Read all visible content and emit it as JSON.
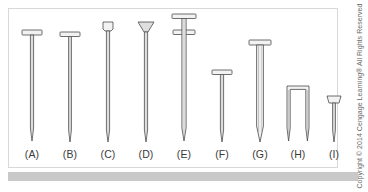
{
  "figure": {
    "background_color": "#ffffff",
    "frame_color": "#d8d8d8",
    "ground_bar_color": "#c9c9c9",
    "stroke_color": "#4a4a4a",
    "fill_color": "#f2f2f2",
    "label_color": "#3a3a3a"
  },
  "credit": {
    "text": "Copyright © 2014 Cengage Learning® All Rights Reserved",
    "color": "#6a6a6a"
  },
  "items": [
    {
      "label": "(A)",
      "name": "nail-a",
      "head": "flat-wide",
      "shank": "slender",
      "x": 14
    },
    {
      "label": "(B)",
      "name": "nail-b",
      "head": "flat-wide",
      "shank": "slender",
      "x": 52
    },
    {
      "label": "(C)",
      "name": "nail-c",
      "head": "flat-cup",
      "shank": "slender",
      "x": 90
    },
    {
      "label": "(D)",
      "name": "nail-d",
      "head": "countersunk-cone",
      "shank": "slender",
      "x": 128
    },
    {
      "label": "(E)",
      "name": "nail-e",
      "head": "duplex-double",
      "shank": "medium",
      "x": 166
    },
    {
      "label": "(F)",
      "name": "nail-f",
      "head": "flat-wide",
      "shank": "short",
      "x": 204
    },
    {
      "label": "(G)",
      "name": "nail-g",
      "head": "flat-heavy",
      "shank": "thick",
      "x": 242
    },
    {
      "label": "(H)",
      "name": "staple-h",
      "head": "staple-crown",
      "shank": "two-legs",
      "x": 280
    },
    {
      "label": "(I)",
      "name": "nail-i",
      "head": "small-flat",
      "shank": "short-tack",
      "x": 316
    }
  ]
}
